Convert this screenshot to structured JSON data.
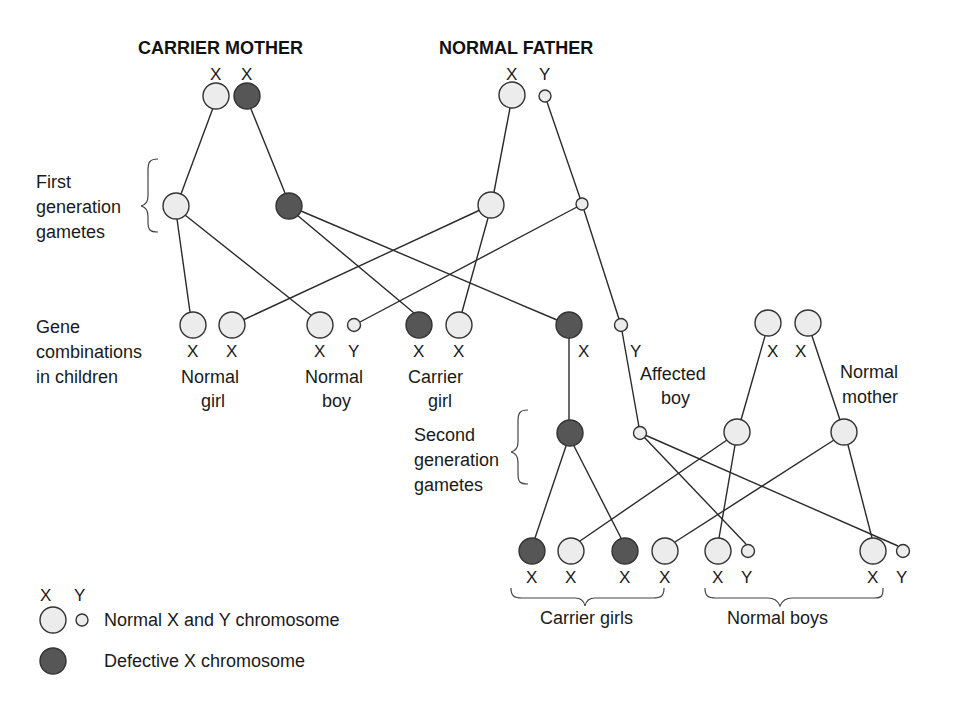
{
  "colors": {
    "normal_fill": "#ececec",
    "defective_fill": "#565656",
    "stroke": "#333333",
    "line": "#2a2a2a"
  },
  "parents": {
    "carrier_mother": {
      "title": "CARRIER MOTHER",
      "chromosomes": [
        "X",
        "X"
      ]
    },
    "normal_father": {
      "title": "NORMAL FATHER",
      "chromosomes": [
        "X",
        "Y"
      ]
    },
    "normal_mother": {
      "label_line1": "Normal",
      "label_line2": "mother",
      "chromosomes": [
        "X",
        "X"
      ]
    }
  },
  "labels": {
    "first_gen": [
      "First",
      "generation",
      "gametes"
    ],
    "gene_combos": [
      "Gene",
      "combinations",
      "in children"
    ],
    "second_gen": [
      "Second",
      "generation",
      "gametes"
    ]
  },
  "children": [
    {
      "genes": [
        "X",
        "X"
      ],
      "label_line1": "Normal",
      "label_line2": "girl"
    },
    {
      "genes": [
        "X",
        "Y"
      ],
      "label_line1": "Normal",
      "label_line2": "boy"
    },
    {
      "genes": [
        "X",
        "X"
      ],
      "label_line1": "Carrier",
      "label_line2": "girl"
    },
    {
      "genes": [
        "X",
        "Y"
      ],
      "label_line1": "Affected",
      "label_line2": "boy"
    }
  ],
  "grandchildren": {
    "genes": [
      "X",
      "X",
      "X",
      "X",
      "X",
      "Y",
      "X",
      "Y"
    ],
    "group_carrier": "Carrier girls",
    "group_normal": "Normal boys"
  },
  "legend": {
    "x_label": "X",
    "y_label": "Y",
    "normal": "Normal X and Y chromosome",
    "defective": "Defective X chromosome"
  }
}
